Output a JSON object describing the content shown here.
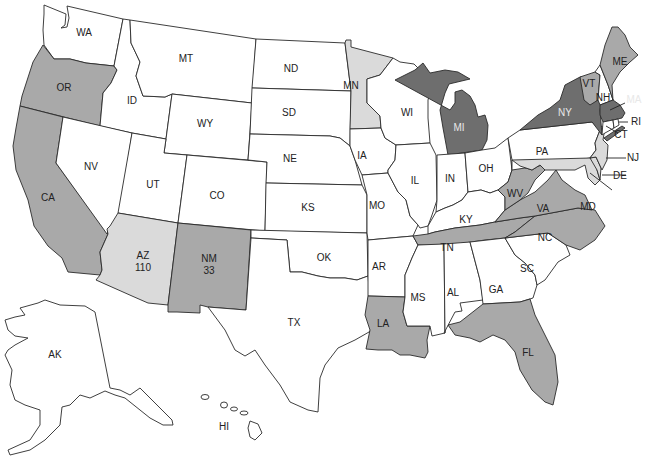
{
  "map": {
    "title": "",
    "shade_colors": {
      "dark": "#6e6e6e",
      "medium": "#a9a9a9",
      "light": "#dadada",
      "none": "#ffffff"
    },
    "states": {
      "WA": {
        "label": "WA",
        "shade": "none"
      },
      "OR": {
        "label": "OR",
        "shade": "medium"
      },
      "CA": {
        "label": "CA",
        "shade": "medium"
      },
      "ID": {
        "label": "ID",
        "shade": "none"
      },
      "NV": {
        "label": "NV",
        "shade": "none"
      },
      "MT": {
        "label": "MT",
        "shade": "none"
      },
      "WY": {
        "label": "WY",
        "shade": "none"
      },
      "UT": {
        "label": "UT",
        "shade": "none"
      },
      "AZ": {
        "label": "AZ",
        "value": "110",
        "shade": "light"
      },
      "CO": {
        "label": "CO",
        "shade": "none"
      },
      "NM": {
        "label": "NM",
        "value": "33",
        "shade": "medium"
      },
      "ND": {
        "label": "ND",
        "shade": "none"
      },
      "SD": {
        "label": "SD",
        "shade": "none"
      },
      "NE": {
        "label": "NE",
        "shade": "none"
      },
      "KS": {
        "label": "KS",
        "shade": "none"
      },
      "OK": {
        "label": "OK",
        "shade": "none"
      },
      "TX": {
        "label": "TX",
        "shade": "none"
      },
      "MN": {
        "label": "MN",
        "shade": "light"
      },
      "IA": {
        "label": "IA",
        "shade": "none"
      },
      "MO": {
        "label": "MO",
        "shade": "none"
      },
      "AR": {
        "label": "AR",
        "shade": "none"
      },
      "LA": {
        "label": "LA",
        "shade": "medium"
      },
      "WI": {
        "label": "WI",
        "shade": "none"
      },
      "IL": {
        "label": "IL",
        "shade": "none"
      },
      "MI": {
        "label": "MI",
        "shade": "dark"
      },
      "IN": {
        "label": "IN",
        "shade": "none"
      },
      "OH": {
        "label": "OH",
        "shade": "none"
      },
      "KY": {
        "label": "KY",
        "shade": "none"
      },
      "TN": {
        "label": "TN",
        "shade": "medium"
      },
      "MS": {
        "label": "MS",
        "shade": "none"
      },
      "AL": {
        "label": "AL",
        "shade": "none"
      },
      "GA": {
        "label": "GA",
        "shade": "none"
      },
      "FL": {
        "label": "FL",
        "shade": "medium"
      },
      "SC": {
        "label": "SC",
        "shade": "none"
      },
      "NC": {
        "label": "NC",
        "shade": "medium"
      },
      "VA": {
        "label": "VA",
        "shade": "medium"
      },
      "WV": {
        "label": "WV",
        "shade": "medium"
      },
      "PA": {
        "label": "PA",
        "shade": "none"
      },
      "NY": {
        "label": "NY",
        "shade": "dark"
      },
      "VT": {
        "label": "VT",
        "shade": "medium"
      },
      "NH": {
        "label": "NH",
        "shade": "none"
      },
      "ME": {
        "label": "ME",
        "shade": "medium"
      },
      "MA": {
        "label": "MA",
        "shade": "dark"
      },
      "RI": {
        "label": "RI",
        "shade": "none"
      },
      "CT": {
        "label": "CT",
        "shade": "none"
      },
      "NJ": {
        "label": "NJ",
        "shade": "light"
      },
      "DE": {
        "label": "DE",
        "shade": "light"
      },
      "MD": {
        "label": "MD",
        "shade": "light"
      },
      "AK": {
        "label": "AK",
        "shade": "none"
      },
      "HI": {
        "label": "HI",
        "shade": "none"
      }
    }
  }
}
